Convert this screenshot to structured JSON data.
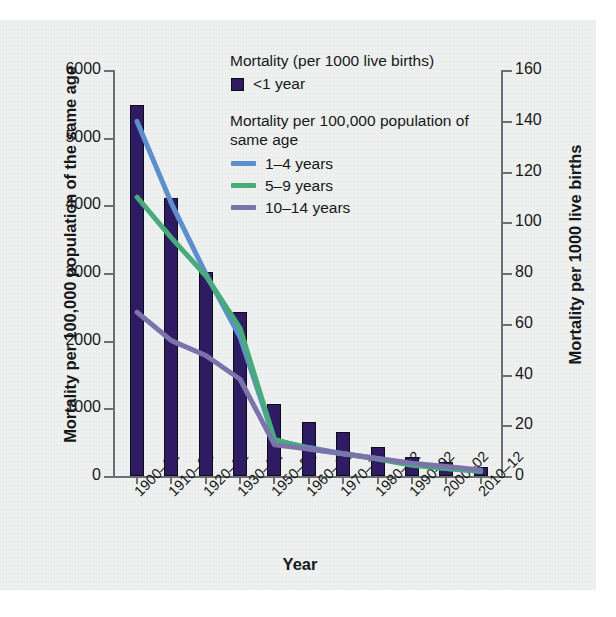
{
  "chart_data": {
    "type": "bar",
    "title": "",
    "xlabel": "Year",
    "ylabel": "Mortality per 100,000 population of the same age",
    "ylabel_right": "Mortality per 1000 live births",
    "categories": [
      "1900–02",
      "1910–12",
      "1920–22",
      "1930–32",
      "1950–52",
      "1960–62",
      "1970–72",
      "1980–82",
      "1990–92",
      "2000–02",
      "2010–12"
    ],
    "ylim": [
      0,
      6000
    ],
    "ylim_right": [
      0,
      160
    ],
    "yticks": [
      "0",
      "1000",
      "2000",
      "3000",
      "4000",
      "5000",
      "6000"
    ],
    "ytick_values": [
      0,
      1000,
      2000,
      3000,
      4000,
      5000,
      6000
    ],
    "yticks_right": [
      "0",
      "20",
      "40",
      "60",
      "80",
      "100",
      "120",
      "140",
      "160"
    ],
    "ytick_values_right": [
      0,
      20,
      40,
      60,
      80,
      100,
      120,
      140,
      160
    ],
    "grid": false,
    "legend_position": "upper-right-inside",
    "series": [
      {
        "name": "<1 year",
        "kind": "bar",
        "axis": "right",
        "units": "per 1000 live births",
        "color": "#2e1b63",
        "values": [
          146,
          109,
          80,
          64,
          28,
          21,
          17,
          11,
          7,
          5,
          4
        ],
        "values_left_scale": [
          5490,
          4110,
          3010,
          2420,
          1060,
          800,
          650,
          430,
          280,
          200,
          140
        ]
      },
      {
        "name": "1–4 years",
        "kind": "line",
        "axis": "left",
        "units": "per 100,000 population of same age",
        "color": "#5b8fd0",
        "values": [
          5240,
          4030,
          2990,
          2050,
          530,
          420,
          330,
          260,
          180,
          110,
          70
        ]
      },
      {
        "name": "5–9 years",
        "kind": "line",
        "axis": "left",
        "units": "per 100,000 population of same age",
        "color": "#46ad7a",
        "values": [
          4120,
          3520,
          2960,
          2180,
          540,
          400,
          330,
          250,
          160,
          110,
          70
        ]
      },
      {
        "name": "10–14 years",
        "kind": "line",
        "axis": "left",
        "units": "per 100,000 population of same age",
        "color": "#7c73ab",
        "values": [
          2420,
          2000,
          1780,
          1430,
          460,
          400,
          330,
          260,
          190,
          140,
          90
        ]
      }
    ]
  },
  "legend": {
    "title_bars": "Mortality (per 1000 live births)",
    "title_lines": "Mortality per 100,000 population of same age",
    "entries": [
      {
        "label": "<1 year",
        "swatch": "box",
        "color": "#2e1b63"
      },
      {
        "label": "1–4 years",
        "swatch": "line",
        "color": "#5b8fd0"
      },
      {
        "label": "5–9 years",
        "swatch": "line",
        "color": "#46ad7a"
      },
      {
        "label": "10–14 years",
        "swatch": "line",
        "color": "#7c73ab"
      }
    ]
  }
}
